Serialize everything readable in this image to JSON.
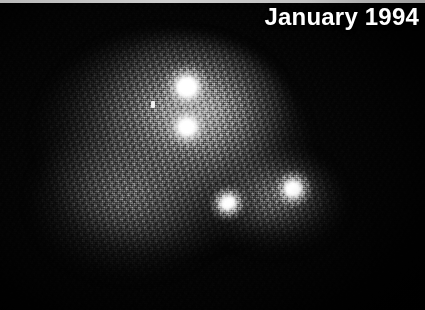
{
  "image": {
    "kind": "astronomical-photograph",
    "subject": "comet fragments with diffuse coma",
    "caption": "January 1994",
    "width": 425,
    "height": 310,
    "background_color": "#000000",
    "coma_color": "#808080",
    "nucleus_color": "#ffffff",
    "caption_color": "#ffffff",
    "top_edge_color": "#c2c2c2",
    "objects": [
      {
        "name": "nucleus-1",
        "label": "bright nucleus upper",
        "x": 187,
        "y": 87
      },
      {
        "name": "nucleus-2",
        "label": "bright nucleus lower",
        "x": 187,
        "y": 127
      },
      {
        "name": "nucleus-3",
        "label": "elongated nucleus left",
        "x": 228,
        "y": 203
      },
      {
        "name": "nucleus-4",
        "label": "bright nucleus right",
        "x": 293,
        "y": 189
      },
      {
        "name": "field-star",
        "label": "faint field star",
        "x": 153,
        "y": 105
      }
    ]
  }
}
